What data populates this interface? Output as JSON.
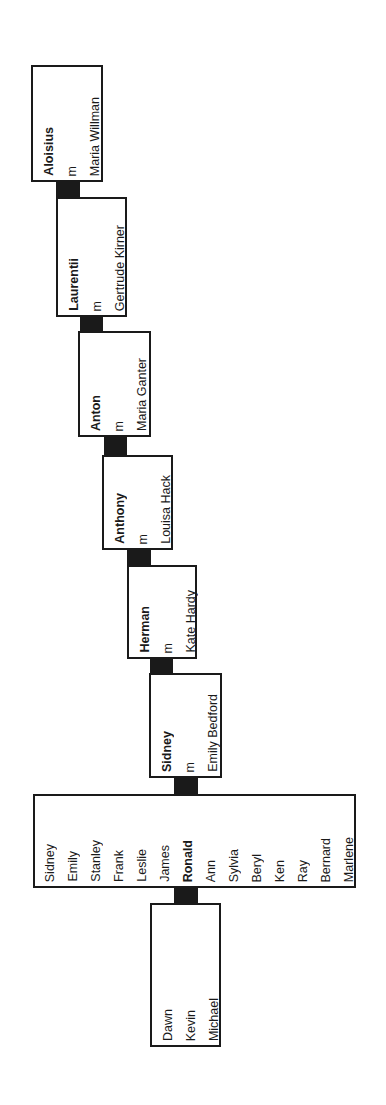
{
  "diagram": {
    "type": "family-tree",
    "orientation": "rotated-90",
    "colors": {
      "border": "#1a1a1a",
      "connector": "#1a1a1a",
      "background": "#ffffff"
    },
    "generations": [
      {
        "name": "Aloisius",
        "marriage": "m",
        "spouse": "Maria Willman"
      },
      {
        "name": "Laurentii",
        "marriage": "m",
        "spouse": "Gertrude Kirner"
      },
      {
        "name": "Anton",
        "marriage": "m",
        "spouse": "Maria Ganter"
      },
      {
        "name": "Anthony",
        "marriage": "m",
        "spouse": "Louisa Hack"
      },
      {
        "name": "Herman",
        "marriage": "m",
        "spouse": "Kate Hardy"
      },
      {
        "name": "Sidney",
        "marriage": "m",
        "spouse": "Emily Bedford"
      }
    ],
    "children": [
      {
        "name": "Sidney",
        "bold": false
      },
      {
        "name": "Emily",
        "bold": false
      },
      {
        "name": "Stanley",
        "bold": false
      },
      {
        "name": "Frank",
        "bold": false
      },
      {
        "name": "Leslie",
        "bold": false
      },
      {
        "name": "James",
        "bold": false
      },
      {
        "name": "Ronald",
        "bold": true
      },
      {
        "name": "Ann",
        "bold": false
      },
      {
        "name": "Sylvia",
        "bold": false
      },
      {
        "name": "Beryl",
        "bold": false
      },
      {
        "name": "Ken",
        "bold": false
      },
      {
        "name": "Ray",
        "bold": false
      },
      {
        "name": "Bernard",
        "bold": false
      },
      {
        "name": "Marlene",
        "bold": false
      }
    ],
    "grandchildren": [
      {
        "name": "Dawn"
      },
      {
        "name": "Kevin"
      },
      {
        "name": "Michael"
      }
    ]
  }
}
